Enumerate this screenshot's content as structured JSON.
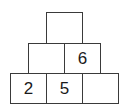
{
  "pyramid": {
    "rows": [
      {
        "cells": [
          {
            "value": ""
          }
        ]
      },
      {
        "cells": [
          {
            "value": ""
          },
          {
            "value": "6"
          }
        ]
      },
      {
        "cells": [
          {
            "value": "2"
          },
          {
            "value": "5"
          },
          {
            "value": ""
          }
        ]
      }
    ],
    "line_color": "#3a3a3a",
    "background": "#ffffff"
  }
}
